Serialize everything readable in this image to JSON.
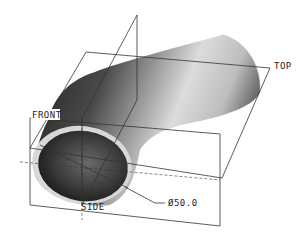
{
  "viewport": {
    "background": "#ffffff",
    "model": "pipe-elbow",
    "colors": {
      "pipe_dark": "#2a2a2a",
      "pipe_mid": "#6e6e6e",
      "pipe_light": "#e8e8e8",
      "wall_ring": "#d8d8d8",
      "datum_line": "#333333"
    }
  },
  "datum_planes": {
    "top": "TOP",
    "front": "FRONT",
    "side": "SIDE"
  },
  "dimension": {
    "symbol": "Ø",
    "value": "50.0",
    "label": "Ø50.0"
  }
}
